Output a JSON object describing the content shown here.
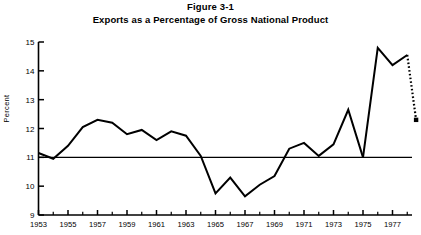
{
  "figure": {
    "title_line_1": "Figure 3-1",
    "title_line_2": "Exports as a Percentage of Gross National Product"
  },
  "chart_data": {
    "type": "line",
    "title": "Exports as a Percentage of Gross National Product",
    "subtitle": "Figure 3-1",
    "xlabel": "",
    "ylabel": "Percent",
    "xlim": [
      1953,
      1978.6
    ],
    "ylim": [
      9,
      15
    ],
    "yticks": [
      9,
      10,
      11,
      12,
      13,
      14,
      15
    ],
    "ytick_labels": [
      "9",
      "10",
      "11",
      "12",
      "13",
      "14",
      "15"
    ],
    "xticks": [
      1953,
      1955,
      1957,
      1959,
      1961,
      1963,
      1965,
      1967,
      1969,
      1971,
      1973,
      1975,
      1977
    ],
    "xtick_labels": [
      "1953",
      "1955",
      "1957",
      "1959",
      "1961",
      "1963",
      "1965",
      "1967",
      "1969",
      "1971",
      "1973",
      "1975",
      "1977"
    ],
    "xminor_ticks": [
      1954,
      1956,
      1958,
      1960,
      1962,
      1964,
      1966,
      1968,
      1970,
      1972,
      1974,
      1976,
      1978
    ],
    "grid": false,
    "legend": false,
    "reference_line": {
      "label": "11 percent reference line",
      "value": 11,
      "orientation": "horizontal"
    },
    "series": [
      {
        "name": "Exports as percent of GNP",
        "style": "solid",
        "x": [
          1953,
          1954,
          1955,
          1956,
          1957,
          1958,
          1959,
          1960,
          1961,
          1962,
          1963,
          1964,
          1965,
          1966,
          1967,
          1968,
          1969,
          1970,
          1971,
          1972,
          1973,
          1974,
          1975
        ],
        "values": [
          11.15,
          10.95,
          11.4,
          12.05,
          12.3,
          12.2,
          11.8,
          11.95,
          11.6,
          11.9,
          11.75,
          11.05,
          9.75,
          10.3,
          9.65,
          10.05,
          10.35,
          11.3,
          11.5,
          11.05,
          11.45,
          12.65,
          11.0
        ]
      },
      {
        "name": "Exports as percent of GNP (continued)",
        "style": "solid",
        "x": [
          1975,
          1976,
          1977,
          1978
        ],
        "values": [
          11.0,
          14.8,
          14.2,
          14.55
        ]
      },
      {
        "name": "Projection",
        "style": "dashed",
        "x": [
          1978,
          1978.6
        ],
        "values": [
          14.55,
          12.3
        ],
        "end_marker": "square"
      }
    ]
  }
}
